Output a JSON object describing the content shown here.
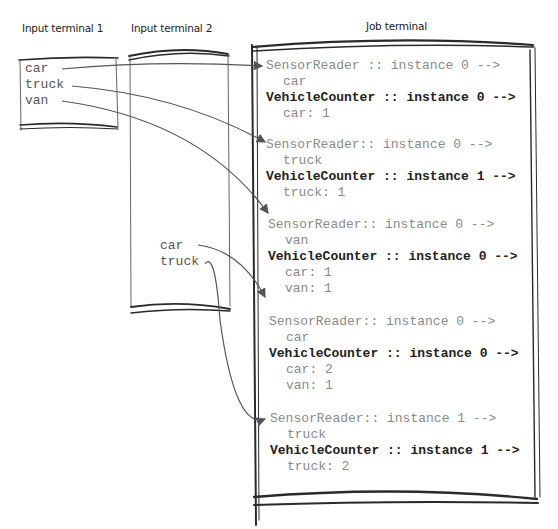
{
  "terminals": {
    "input1": {
      "title": "Input terminal 1",
      "lines": [
        "car",
        "truck",
        "van"
      ]
    },
    "input2": {
      "title": "Input terminal 2",
      "lines": [
        "car",
        "truck"
      ]
    },
    "job": {
      "title": "Job terminal",
      "entries": [
        {
          "reader": "SensorReader :: instance 0 -->",
          "input": "car",
          "counter": "VehicleCounter :: instance 0 -->",
          "counts": [
            "car: 1"
          ]
        },
        {
          "reader": "SensorReader:: instance 0 -->",
          "input": "truck",
          "counter": "VehicleCounter :: instance 1 -->",
          "counts": [
            "truck: 1"
          ]
        },
        {
          "reader": "SensorReader:: instance 0 -->",
          "input": "van",
          "counter": "VehicleCounter :: instance 0 -->",
          "counts": [
            "car: 1",
            "van: 1"
          ]
        },
        {
          "reader": "SensorReader:: instance 0 -->",
          "input": "car",
          "counter": "VehicleCounter :: instance 0 -->",
          "counts": [
            "car: 2",
            "van: 1"
          ]
        },
        {
          "reader": "SensorReader:: instance 1 -->",
          "input": "truck",
          "counter": "VehicleCounter :: instance 1 -->",
          "counts": [
            "truck: 2"
          ]
        }
      ]
    }
  },
  "arrows": [
    {
      "from": "input1.car",
      "to": "job.entry0"
    },
    {
      "from": "input1.truck",
      "to": "job.entry1"
    },
    {
      "from": "input1.van",
      "to": "job.entry2"
    },
    {
      "from": "input2.car",
      "to": "job.entry3"
    },
    {
      "from": "input2.truck",
      "to": "job.entry4"
    }
  ],
  "colors": {
    "stroke": "#2a2a2a",
    "arrow": "#555555",
    "reader_text": "#8a8a8a",
    "counter_text": "#222222"
  }
}
